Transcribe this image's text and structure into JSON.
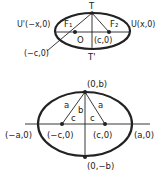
{
  "diagrams": {
    "top": {
      "title": "Ellipse with foci and vertex T",
      "labels": {
        "T": "T",
        "T_prime": "T'",
        "F1": "F₁",
        "F2": "F₂",
        "U_prime": "U'(−x,0)",
        "U": "U(x,0)",
        "origin": "O",
        "focus_right": "(c,0)",
        "focus_left": "(−c,0)"
      }
    },
    "bottom": {
      "title": "Ellipse showing relationship a² = b² + c²",
      "labels": {
        "top_vertex": "(0,b)",
        "bottom_vertex": "(0,−b)",
        "left_vertex": "(−a,0)",
        "right_vertex": "(a,0)",
        "left_focus": "(−c,0)",
        "right_focus": "(c,0)",
        "side_a_left": "a",
        "side_a_right": "a",
        "side_b": "b",
        "side_c_left": "c",
        "side_c_right": "c"
      }
    }
  },
  "colors": {
    "stroke": "#222222",
    "background": "#ffffff"
  }
}
